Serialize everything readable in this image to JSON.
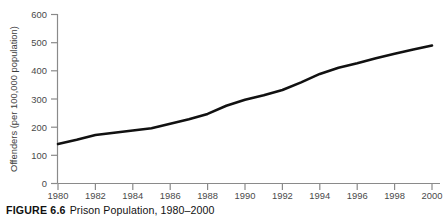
{
  "caption": {
    "figure_number": "FIGURE 6.6",
    "title": "Prison Population, 1980–2000"
  },
  "chart_data": {
    "type": "line",
    "title": "Prison Population, 1980–2000",
    "xlabel": "",
    "ylabel": "Offenders (per 100,000 population)",
    "x": [
      1980,
      1981,
      1982,
      1983,
      1984,
      1985,
      1986,
      1987,
      1988,
      1989,
      1990,
      1991,
      1992,
      1993,
      1994,
      1995,
      1996,
      1997,
      1998,
      1999,
      2000
    ],
    "values": [
      140,
      155,
      172,
      180,
      188,
      196,
      212,
      228,
      247,
      276,
      297,
      313,
      332,
      359,
      389,
      411,
      427,
      445,
      461,
      476,
      490
    ],
    "series": [
      {
        "name": "Offenders per 100,000 population",
        "values": [
          140,
          155,
          172,
          180,
          188,
          196,
          212,
          228,
          247,
          276,
          297,
          313,
          332,
          359,
          389,
          411,
          427,
          445,
          461,
          476,
          490
        ]
      }
    ],
    "xlim": [
      1980,
      2000
    ],
    "ylim": [
      0,
      600
    ],
    "x_ticks": [
      1980,
      1982,
      1984,
      1986,
      1988,
      1990,
      1992,
      1994,
      1996,
      1998,
      2000
    ],
    "x_tick_labels": [
      "1980",
      "1982",
      "1984",
      "1986",
      "1988",
      "1990",
      "1992",
      "1994",
      "1996",
      "1998",
      "2000"
    ],
    "y_ticks": [
      0,
      100,
      200,
      300,
      400,
      500,
      600
    ],
    "y_tick_labels": [
      "0",
      "100",
      "200",
      "300",
      "400",
      "500",
      "600"
    ],
    "grid": false,
    "legend": "none",
    "line_color": "#111111",
    "axis_color": "#8a8a8a"
  },
  "axis": {
    "y_title": "Offenders (per 100,000 population)",
    "y_ticks": [
      "600",
      "500",
      "400",
      "300",
      "200",
      "100",
      "0"
    ],
    "x_ticks": [
      "1980",
      "1982",
      "1984",
      "1986",
      "1988",
      "1990",
      "1992",
      "1994",
      "1996",
      "1998",
      "2000"
    ]
  }
}
